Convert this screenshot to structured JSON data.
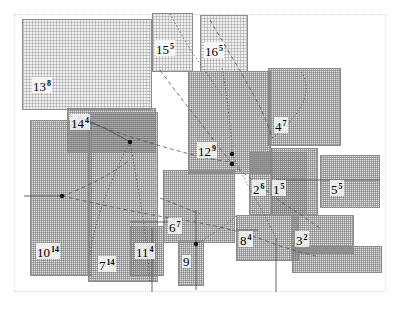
{
  "figure": {
    "type": "rectangle-packing-diagram",
    "title": "",
    "canvas": {
      "width": 400,
      "height": 309
    },
    "frame": {
      "x": 14,
      "y": 14,
      "width": 372,
      "height": 278,
      "style": "dotted",
      "color": "#d8d8d8"
    },
    "palette": {
      "rect_fill": "#aaaaaa",
      "rect_fill_light": "#cdcdcd",
      "rect_border": "#8c8c8c",
      "edge": "#4a4a4a",
      "label": "#000000",
      "background": "#ffffff"
    }
  },
  "rectangles": [
    {
      "id": "r13",
      "label": "13",
      "weight": "8",
      "x": 22,
      "y": 19,
      "width": 130,
      "height": 91,
      "shade": "light"
    },
    {
      "id": "r15",
      "label": "15",
      "weight": "5",
      "x": 152,
      "y": 13,
      "width": 41,
      "height": 59,
      "shade": "light"
    },
    {
      "id": "r16",
      "label": "16",
      "weight": "5",
      "x": 200,
      "y": 15,
      "width": 48,
      "height": 57,
      "shade": "light"
    },
    {
      "id": "r12",
      "label": "12",
      "weight": "9",
      "x": 188,
      "y": 71,
      "width": 83,
      "height": 103,
      "shade": "dark"
    },
    {
      "id": "r14",
      "label": "14",
      "weight": "4",
      "x": 67,
      "y": 108,
      "width": 89,
      "height": 45,
      "shade": "dark"
    },
    {
      "id": "r4a",
      "label": "4",
      "weight": "7",
      "x": 268,
      "y": 68,
      "width": 73,
      "height": 78,
      "shade": "dark"
    },
    {
      "id": "r10",
      "label": "10",
      "weight": "14",
      "x": 30,
      "y": 120,
      "width": 62,
      "height": 156,
      "shade": "dark"
    },
    {
      "id": "r7",
      "label": "7",
      "weight": "14",
      "x": 88,
      "y": 112,
      "width": 70,
      "height": 170,
      "shade": "dark"
    },
    {
      "id": "r11",
      "label": "11",
      "weight": "4",
      "x": 130,
      "y": 226,
      "width": 34,
      "height": 50,
      "shade": "dark"
    },
    {
      "id": "r6",
      "label": "6",
      "weight": "7",
      "x": 163,
      "y": 170,
      "width": 72,
      "height": 73,
      "shade": "dark"
    },
    {
      "id": "r9",
      "label": "9",
      "weight": "4",
      "x": 178,
      "y": 240,
      "width": 26,
      "height": 46,
      "shade": "dark"
    },
    {
      "id": "r8",
      "label": "8",
      "weight": "4",
      "x": 236,
      "y": 215,
      "width": 63,
      "height": 46,
      "shade": "dark"
    },
    {
      "id": "r3",
      "label": "3",
      "weight": "2",
      "x": 291,
      "y": 215,
      "width": 63,
      "height": 39,
      "shade": "dark"
    },
    {
      "id": "r2",
      "label": "2",
      "weight": "6",
      "x": 249,
      "y": 152,
      "width": 58,
      "height": 63,
      "shade": "dark"
    },
    {
      "id": "r1",
      "label": "1",
      "weight": "5",
      "x": 271,
      "y": 148,
      "width": 47,
      "height": 67,
      "shade": "dark"
    },
    {
      "id": "r5",
      "label": "5",
      "weight": "5",
      "x": 320,
      "y": 155,
      "width": 60,
      "height": 53,
      "shade": "dark"
    },
    {
      "id": "rband",
      "label": "",
      "weight": "",
      "x": 292,
      "y": 246,
      "width": 90,
      "height": 27,
      "shade": "dark"
    }
  ],
  "labels": [
    {
      "text": "13",
      "sup": "8",
      "x": 32,
      "y": 77
    },
    {
      "text": "15",
      "sup": "5",
      "x": 155,
      "y": 40
    },
    {
      "text": "16",
      "sup": "5",
      "x": 204,
      "y": 42
    },
    {
      "text": "14",
      "sup": "4",
      "x": 70,
      "y": 114
    },
    {
      "text": "12",
      "sup": "9",
      "x": 197,
      "y": 142
    },
    {
      "text": "4",
      "sup": "7",
      "x": 274,
      "y": 117
    },
    {
      "text": "2",
      "sup": "6",
      "x": 252,
      "y": 180
    },
    {
      "text": "1",
      "sup": "5",
      "x": 272,
      "y": 180
    },
    {
      "text": "5",
      "sup": "5",
      "x": 330,
      "y": 180
    },
    {
      "text": "10",
      "sup": "14",
      "x": 36,
      "y": 243
    },
    {
      "text": "7",
      "sup": "14",
      "x": 98,
      "y": 256
    },
    {
      "text": "11",
      "sup": "4",
      "x": 135,
      "y": 243
    },
    {
      "text": "6",
      "sup": "7",
      "x": 168,
      "y": 218
    },
    {
      "text": "9",
      "sup": "",
      "x": 182,
      "y": 255
    },
    {
      "text": "8",
      "sup": "4",
      "x": 239,
      "y": 231
    },
    {
      "text": "3",
      "sup": "2",
      "x": 295,
      "y": 231
    }
  ],
  "edges": [
    {
      "style": "dot",
      "d": "M170,14 C178,28 186,44 196,58 C206,72 214,84 222,96"
    },
    {
      "style": "dash",
      "d": "M210,20 C224,44 240,70 252,92 C262,110 268,124 272,138"
    },
    {
      "style": "dash",
      "d": "M160,70 C176,92 192,112 206,130 C218,146 226,156 232,164"
    },
    {
      "style": "dot",
      "d": "M222,68 C226,88 228,108 230,126 C232,140 232,148 232,154"
    },
    {
      "style": "dash",
      "d": "M70,116 C110,130 150,144 190,154 C214,160 228,162 236,162"
    },
    {
      "style": "solid",
      "d": "M78,117 C98,124 116,134 130,142"
    },
    {
      "style": "dot",
      "d": "M130,142 C120,160 110,184 102,206 C96,224 92,240 90,256"
    },
    {
      "style": "dot",
      "d": "M130,142 C134,164 138,188 142,212 C146,236 148,258 150,282"
    },
    {
      "style": "dash",
      "d": "M62,196 C90,186 114,172 130,160"
    },
    {
      "style": "solid",
      "d": "M24,196 L62,196"
    },
    {
      "style": "dash",
      "d": "M62,196 C98,204 134,212 170,218 C196,222 216,226 232,230"
    },
    {
      "style": "dot",
      "d": "M232,154 C240,170 248,186 256,200 C264,214 270,226 276,238"
    },
    {
      "style": "dash",
      "d": "M232,164 C250,178 268,192 284,204 C300,214 312,222 322,230"
    },
    {
      "style": "dot",
      "d": "M272,138 C286,128 298,114 304,100 C308,88 306,78 300,70"
    },
    {
      "style": "solid",
      "d": "M276,180 L380,180"
    },
    {
      "style": "solid",
      "d": "M196,210 L196,290"
    },
    {
      "style": "solid",
      "d": "M152,228 L152,292"
    },
    {
      "style": "solid",
      "d": "M276,238 L276,292"
    },
    {
      "style": "dash",
      "d": "M232,230 C248,234 264,240 280,246 C294,250 306,254 316,256"
    },
    {
      "style": "dot",
      "d": "M196,244 C210,236 224,226 236,216"
    },
    {
      "style": "dash",
      "d": "M160,198 C176,204 190,210 200,214"
    },
    {
      "style": "solid",
      "d": "M130,222 L170,222"
    },
    {
      "style": "solid",
      "d": "M236,230 L258,230"
    }
  ],
  "nodes": [
    {
      "x": 62,
      "y": 196
    },
    {
      "x": 130,
      "y": 142
    },
    {
      "x": 232,
      "y": 154
    },
    {
      "x": 196,
      "y": 244
    },
    {
      "x": 232,
      "y": 164
    }
  ]
}
